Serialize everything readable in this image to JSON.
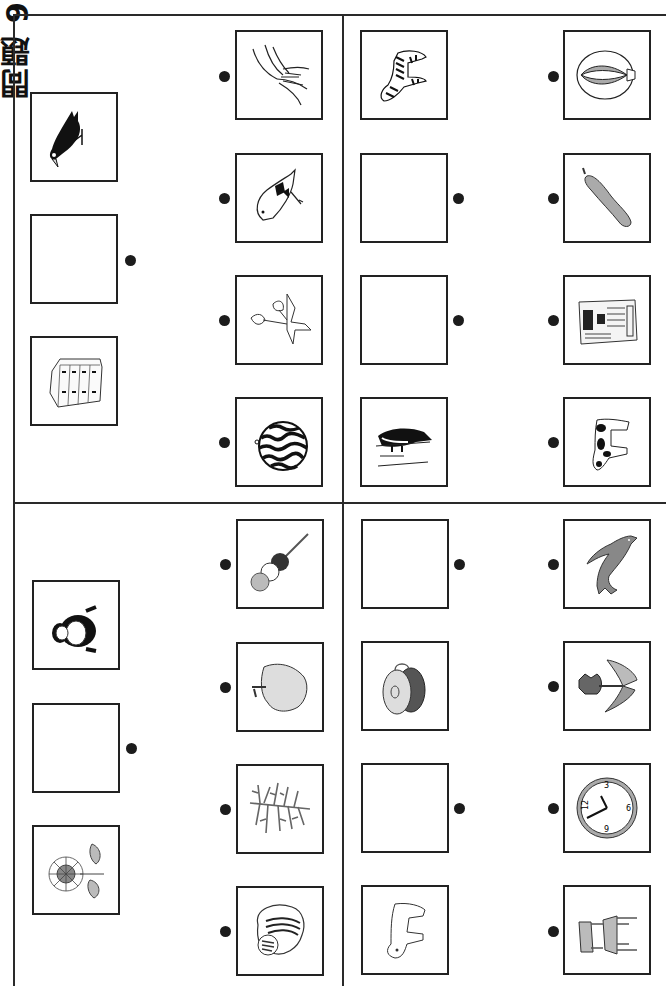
{
  "side_title": "問題 9",
  "colors": {
    "line": "#2a2a2a",
    "dot": "#1c1c1c",
    "box_border": "#222222"
  },
  "quadrants": [
    {
      "id": "top-left",
      "left_column": [
        {
          "picture": "crow",
          "blank": false
        },
        {
          "picture": null,
          "blank": true,
          "has_dot": true
        },
        {
          "picture": "drawer-cabinet",
          "blank": false
        }
      ],
      "right_column": [
        {
          "picture": "pampas-grass"
        },
        {
          "picture": "small-bird"
        },
        {
          "picture": "flowering-branch"
        },
        {
          "picture": "watermelon"
        }
      ]
    },
    {
      "id": "top-right",
      "left_column": [
        {
          "picture": "zebra",
          "blank": false
        },
        {
          "picture": null,
          "blank": true,
          "has_dot": true
        },
        {
          "picture": null,
          "blank": true,
          "has_dot": true
        },
        {
          "picture": "penguin",
          "blank": false
        }
      ],
      "right_column": [
        {
          "picture": "hot-air-balloon"
        },
        {
          "picture": "loofah-gourd"
        },
        {
          "picture": "newspaper"
        },
        {
          "picture": "cow"
        }
      ]
    },
    {
      "id": "bottom-left",
      "left_column": [
        {
          "picture": "gorilla",
          "blank": false
        },
        {
          "picture": null,
          "blank": true,
          "has_dot": true
        },
        {
          "picture": "sunflower",
          "blank": false
        }
      ],
      "right_column": [
        {
          "picture": "dango-skewer"
        },
        {
          "picture": "apple"
        },
        {
          "picture": "coral"
        },
        {
          "picture": "chipmunk"
        }
      ]
    },
    {
      "id": "bottom-right",
      "left_column": [
        {
          "picture": null,
          "blank": true,
          "has_dot": true
        },
        {
          "picture": "castanets",
          "blank": false
        },
        {
          "picture": null,
          "blank": true,
          "has_dot": true
        },
        {
          "picture": "hippopotamus",
          "blank": false
        }
      ],
      "right_column": [
        {
          "picture": "dolphin"
        },
        {
          "picture": "tulip"
        },
        {
          "picture": "wall-clock"
        },
        {
          "picture": "chair"
        }
      ]
    }
  ],
  "clock_numbers": [
    "12",
    "3",
    "6",
    "9"
  ]
}
